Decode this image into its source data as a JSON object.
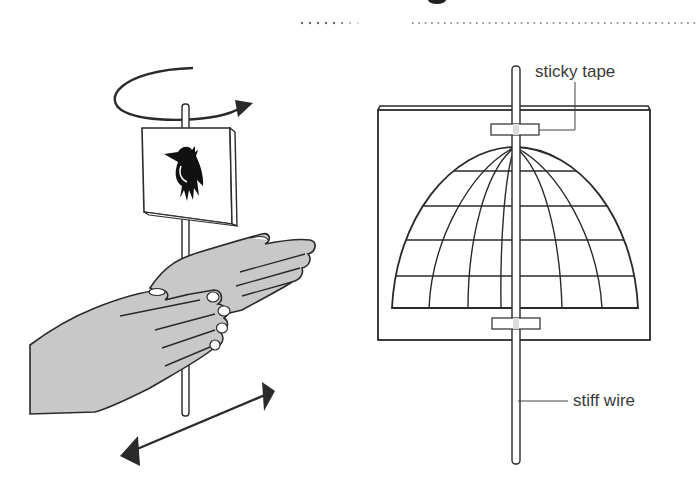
{
  "figure": {
    "left_panel": {
      "description": "Hands rolling a stick with a bird card attached; rotation arrow above, back-and-forth arrow below",
      "card_icon": "bird-icon",
      "rotation_arrow": "rotation-arrow-icon",
      "motion_arrow": "double-arrow-icon"
    },
    "right_panel": {
      "labels": {
        "tape": "sticky tape",
        "wire": "stiff wire"
      },
      "description": "Card with dome grid (cage) drawing attached to a stiff wire with two pieces of sticky tape"
    }
  },
  "colors": {
    "line": "#2a2a2a",
    "hand_fill": "#c8c8c8",
    "dots": "#555555"
  }
}
